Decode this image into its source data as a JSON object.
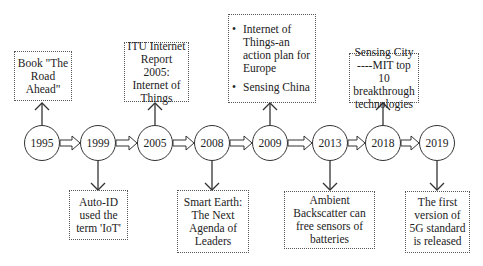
{
  "timeline": {
    "events": [
      {
        "year": "1995",
        "position": "above",
        "text": "Book \"The Road Ahead\""
      },
      {
        "year": "1999",
        "position": "below",
        "text": "Auto-ID used the term 'IoT'"
      },
      {
        "year": "2005",
        "position": "above",
        "text": "ITU Internet Report 2005: Internet of Things"
      },
      {
        "year": "2008",
        "position": "below",
        "text": "Smart Earth: The Next Agenda of Leaders"
      },
      {
        "year": "2009",
        "position": "above",
        "items": [
          "Internet of Things-an action plan for Europe",
          "Sensing China"
        ]
      },
      {
        "year": "2013",
        "position": "below",
        "text": "Ambient Backscatter can free sensors of batteries"
      },
      {
        "year": "2018",
        "position": "above",
        "text": "Sensing City ----MIT top 10 breakthrough technologies"
      },
      {
        "year": "2019",
        "position": "below",
        "text": "The first version of 5G standard is released"
      }
    ]
  },
  "colors": {
    "line": "#333333",
    "border": "#555555",
    "background": "#ffffff"
  }
}
